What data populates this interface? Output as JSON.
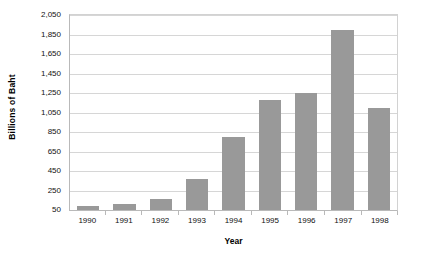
{
  "chart_data": {
    "type": "bar",
    "title": "",
    "xlabel": "Year",
    "ylabel": "Billions of Baht",
    "categories": [
      "1990",
      "1991",
      "1992",
      "1993",
      "1994",
      "1995",
      "1996",
      "1997",
      "1998"
    ],
    "values": [
      95,
      110,
      160,
      365,
      800,
      1180,
      1255,
      1900,
      1100
    ],
    "ylim": [
      50,
      2050
    ],
    "y_ticks": [
      50,
      250,
      450,
      650,
      850,
      1050,
      1250,
      1450,
      1650,
      1850,
      2050
    ],
    "y_tick_labels": [
      "50",
      "250",
      "450",
      "650",
      "850",
      "1,050",
      "1,250",
      "1,450",
      "1,650",
      "1,850",
      "2,050"
    ],
    "grid": true,
    "legend": "none",
    "series": [
      {
        "name": "Billions of Baht",
        "color": "#999999",
        "values": [
          95,
          110,
          160,
          365,
          800,
          1180,
          1255,
          1900,
          1100
        ]
      }
    ],
    "colors": {
      "bar": "#999999",
      "gridline": "#d6d6d6",
      "axis": "#b9b9b9",
      "background": "#ffffff",
      "text": "#111111"
    }
  }
}
